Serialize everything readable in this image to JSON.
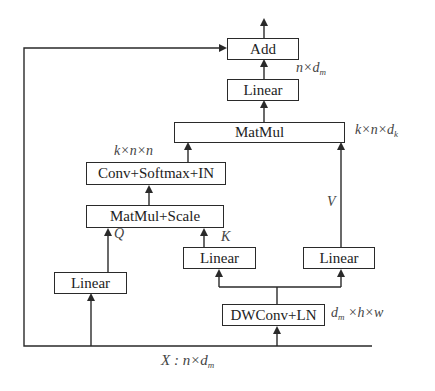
{
  "diagram": {
    "nodes": {
      "add": "Add",
      "linear_out": "Linear",
      "matmul": "MatMul",
      "conv_softmax_in": "Conv+Softmax+IN",
      "matmul_scale": "MatMul+Scale",
      "linear_q": "Linear",
      "linear_k": "Linear",
      "linear_v": "Linear",
      "dwconv_ln": "DWConv+LN"
    },
    "labels": {
      "linear_out_shape_main": "n×d",
      "linear_out_shape_sub": "m",
      "matmul_shape_main": "k×n×d",
      "matmul_shape_sub": "k",
      "attn_shape": "k×n×n",
      "q": "Q",
      "k": "K",
      "v": "V",
      "dwconv_shape_pre": "d",
      "dwconv_shape_sub": "m",
      "dwconv_shape_post": " ×h×w",
      "input_main": "X : n×d",
      "input_sub": "m"
    },
    "colors": {
      "line": "#2a2a2a",
      "text": "#222222",
      "label": "#444444"
    }
  }
}
